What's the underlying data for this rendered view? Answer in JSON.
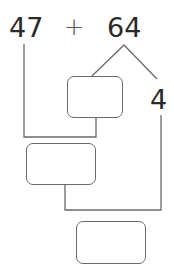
{
  "problem": {
    "left_operand": "47",
    "operator": "+",
    "right_operand": "64",
    "split_part": "4"
  },
  "answer_boxes": [
    {
      "id": "box-split-remainder",
      "value": ""
    },
    {
      "id": "box-partial-sum",
      "value": ""
    },
    {
      "id": "box-final-sum",
      "value": ""
    }
  ],
  "colors": {
    "text": "#2a2a2a",
    "line": "#6a6a6a",
    "background": "#ffffff"
  }
}
